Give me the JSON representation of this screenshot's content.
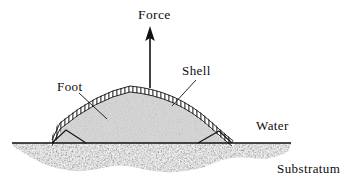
{
  "figure": {
    "type": "scientific-diagram",
    "background_color": "#ffffff",
    "ink_color": "#0d0d0d",
    "width": 352,
    "height": 185
  },
  "labels": {
    "force": "Force",
    "shell": "Shell",
    "foot": "Foot",
    "water": "Water",
    "substratum": "Substratum"
  },
  "diagram_data": {
    "type": "cross-section",
    "waterline_y": 143,
    "waterline_x_start": 12,
    "waterline_x_end": 291,
    "dome": {
      "left_base_x": 52,
      "right_base_x": 232,
      "apex_x": 130,
      "apex_y": 89,
      "base_y": 143,
      "shell_band_thickness": 5,
      "shell_hatch_spacing": 4,
      "interior_fill": "#d8d8d8",
      "interior_texture": "fine-stipple"
    },
    "force_arrow": {
      "x": 150,
      "tail_y": 88,
      "head_y": 30,
      "head_width": 9,
      "head_length": 13,
      "direction": "up"
    },
    "substratum": {
      "top_y": 143,
      "max_depth_y": 175,
      "x_start": 12,
      "x_end": 291,
      "texture": "coarse-stipple",
      "fill": "#5a5a5a"
    },
    "leaders": [
      {
        "name": "foot-leader",
        "from": [
          79,
          93
        ],
        "to": [
          107,
          119
        ]
      },
      {
        "name": "shell-leader",
        "from": [
          196,
          80
        ],
        "to": [
          172,
          106
        ]
      }
    ],
    "base_notches": [
      {
        "name": "left-notch",
        "apex": [
          66,
          130
        ],
        "left": [
          52,
          143
        ],
        "right": [
          86,
          143
        ]
      },
      {
        "name": "right-notch",
        "apex": [
          219,
          131
        ],
        "left": [
          198,
          143
        ],
        "right": [
          232,
          143
        ]
      }
    ]
  }
}
